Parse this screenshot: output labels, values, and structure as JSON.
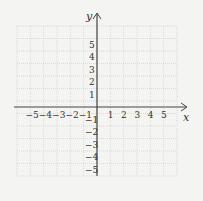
{
  "chart_data": {
    "type": "coordinate-plane",
    "title": "",
    "xlabel": "x",
    "ylabel": "y",
    "xlim": [
      -5,
      5
    ],
    "ylim": [
      -5,
      5
    ],
    "grid": true,
    "x_ticks": [
      "-5",
      "-4",
      "-3",
      "-2",
      "-1",
      "1",
      "2",
      "3",
      "4",
      "5"
    ],
    "y_ticks": [
      "5",
      "4",
      "3",
      "2",
      "1",
      "-1",
      "-2",
      "-3",
      "-4",
      "-5"
    ]
  },
  "colors": {
    "background": "#f4f4f2",
    "grid": "#c8c8c8",
    "axis": "#444444"
  }
}
